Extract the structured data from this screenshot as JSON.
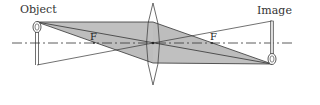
{
  "diagram": {
    "type": "thin-lens-ray-diagram",
    "labels": {
      "object": "Object",
      "image": "Image",
      "focal_left": "F",
      "focal_right": "F"
    },
    "colors": {
      "shading": "#b8b8b8",
      "lines": "#333333",
      "background": "#ffffff"
    }
  }
}
